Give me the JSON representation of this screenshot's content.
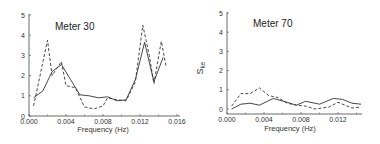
{
  "chart_data": [
    {
      "type": "line",
      "title": "Meter 30",
      "xlabel": "Frequency (Hz)",
      "ylabel": "",
      "xlim": [
        0.0,
        0.016
      ],
      "ylim": [
        0,
        5
      ],
      "xticks": [
        "0.000",
        "0.004",
        "0.008",
        "0.012",
        "0.016"
      ],
      "yticks": [
        "0",
        "1",
        "2",
        "3",
        "4",
        "5"
      ],
      "grid": false,
      "series": [
        {
          "name": "solid",
          "style": "solid",
          "x": [
            0.0005,
            0.0015,
            0.0025,
            0.0035,
            0.0045,
            0.0055,
            0.0065,
            0.0075,
            0.0085,
            0.0095,
            0.0105,
            0.0115,
            0.0125,
            0.0135,
            0.0145
          ],
          "values": [
            0.9,
            1.25,
            2.2,
            2.55,
            1.8,
            1.05,
            1.0,
            0.9,
            0.95,
            0.75,
            0.8,
            1.8,
            3.65,
            1.7,
            2.9
          ]
        },
        {
          "name": "dashed",
          "style": "dashed",
          "x": [
            0.0005,
            0.002,
            0.0025,
            0.0035,
            0.004,
            0.005,
            0.006,
            0.007,
            0.008,
            0.0085,
            0.0095,
            0.0105,
            0.0115,
            0.0123,
            0.013,
            0.0135,
            0.0143,
            0.0148
          ],
          "values": [
            0.5,
            3.75,
            2.0,
            2.7,
            1.5,
            1.4,
            0.45,
            0.35,
            0.5,
            0.9,
            0.8,
            0.75,
            1.7,
            4.5,
            3.0,
            1.6,
            3.7,
            2.5
          ]
        }
      ]
    },
    {
      "type": "line",
      "title": "Meter 70",
      "xlabel": "Frequency (Hz)",
      "ylabel": "S_ke",
      "xlim": [
        0.0,
        0.015
      ],
      "ylim": [
        0,
        5
      ],
      "xticks": [
        "0.000",
        "0.004",
        "0.008",
        "0.012"
      ],
      "yticks": [
        "0",
        "1",
        "2",
        "3",
        "4",
        "5"
      ],
      "grid": false,
      "series": [
        {
          "name": "solid",
          "style": "solid",
          "x": [
            0.0005,
            0.0015,
            0.0025,
            0.0035,
            0.005,
            0.0065,
            0.0075,
            0.0085,
            0.01,
            0.0115,
            0.0125,
            0.0135,
            0.0145
          ],
          "values": [
            0.0,
            0.25,
            0.3,
            0.2,
            0.55,
            0.35,
            0.2,
            0.4,
            0.25,
            0.55,
            0.5,
            0.3,
            0.25
          ]
        },
        {
          "name": "dashed",
          "style": "dashed",
          "x": [
            0.0005,
            0.0015,
            0.0025,
            0.0035,
            0.0045,
            0.0055,
            0.0065,
            0.0075,
            0.0085,
            0.0095,
            0.011,
            0.012,
            0.0135,
            0.0145
          ],
          "values": [
            0.15,
            0.8,
            0.8,
            1.1,
            0.7,
            0.6,
            0.3,
            0.2,
            0.15,
            0.0,
            0.1,
            0.35,
            0.05,
            0.1
          ]
        }
      ]
    }
  ],
  "panels": [
    {
      "title": "Meter 30",
      "xlabel": "Frequency (Hz)",
      "ylabel": ""
    },
    {
      "title": "Meter 70",
      "xlabel": "Frequency (Hz)",
      "ylabel_main": "S",
      "ylabel_sub": "ke"
    }
  ]
}
